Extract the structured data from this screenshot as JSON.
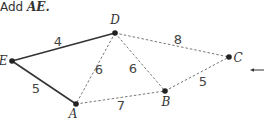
{
  "caption": {
    "prefix": "Add ",
    "variable": "AE.",
    "full": "Add AE."
  },
  "colors": {
    "solid_edge": "#333333",
    "dashed_edge": "#777777",
    "node": "#222222",
    "text": "#333333"
  },
  "nodes": [
    {
      "id": "D",
      "label": "D"
    },
    {
      "id": "E",
      "label": "E"
    },
    {
      "id": "A",
      "label": "A"
    },
    {
      "id": "B",
      "label": "B"
    },
    {
      "id": "C",
      "label": "C"
    }
  ],
  "edges": [
    {
      "from": "E",
      "to": "D",
      "weight": "4",
      "style": "solid",
      "in_tree": true
    },
    {
      "from": "E",
      "to": "A",
      "weight": "5",
      "style": "solid",
      "in_tree": true
    },
    {
      "from": "D",
      "to": "A",
      "weight": "6",
      "style": "dashed",
      "in_tree": false
    },
    {
      "from": "D",
      "to": "B",
      "weight": "6",
      "style": "dashed",
      "in_tree": false
    },
    {
      "from": "D",
      "to": "C",
      "weight": "8",
      "style": "dashed",
      "in_tree": false
    },
    {
      "from": "A",
      "to": "B",
      "weight": "7",
      "style": "dashed",
      "in_tree": false
    },
    {
      "from": "B",
      "to": "C",
      "weight": "5",
      "style": "dashed",
      "in_tree": false
    }
  ],
  "arrow": {
    "direction": "left",
    "icon": "arrow-left-icon"
  }
}
